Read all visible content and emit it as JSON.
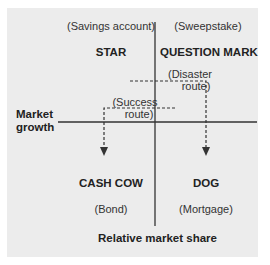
{
  "diagram": {
    "type": "BCG growth-share matrix",
    "axes": {
      "y_label_line1": "Market",
      "y_label_line2": "growth",
      "x_label": "Relative market share"
    },
    "quadrants": {
      "top_left": {
        "name": "STAR",
        "example": "(Savings account)"
      },
      "top_right": {
        "name": "QUESTION MARK",
        "example": "(Sweepstake)"
      },
      "bottom_left": {
        "name": "CASH COW",
        "example": "(Bond)"
      },
      "bottom_right": {
        "name": "DOG",
        "example": "(Mortgage)"
      }
    },
    "routes": {
      "success": {
        "line1": "(Success",
        "line2": "route)",
        "from": "QUESTION MARK",
        "to": "CASH COW"
      },
      "disaster": {
        "line1": "(Disaster",
        "line2": "route)",
        "from": "STAR",
        "to": "DOG"
      }
    },
    "colors": {
      "background": "#ececec",
      "axis": "#333333",
      "text": "#2b2b2b"
    }
  }
}
